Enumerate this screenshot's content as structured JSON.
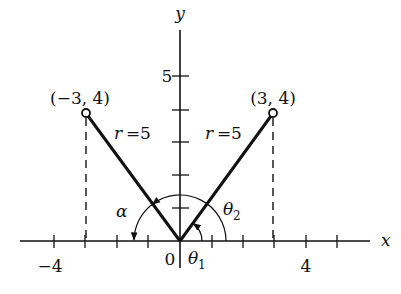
{
  "figure": {
    "axes": {
      "x_label": "x",
      "y_label": "y",
      "origin_label": "0",
      "x_tick_label_neg4": "−4",
      "x_tick_label_4": "4",
      "y_tick_label_5": "5",
      "x_ticks": [
        -4,
        -3,
        -2,
        -1,
        1,
        2,
        3,
        4,
        5
      ],
      "y_ticks": [
        1,
        2,
        3,
        4,
        5
      ]
    },
    "points": [
      {
        "label": "(−3, 4)",
        "x": -3,
        "y": 4
      },
      {
        "label": "(3, 4)",
        "x": 3,
        "y": 4
      }
    ],
    "segments": [
      {
        "label_var": "r",
        "label_eq": "=",
        "label_val": "5",
        "from": [
          0,
          0
        ],
        "to": [
          -3,
          4
        ]
      },
      {
        "label_var": "r",
        "label_eq": "=",
        "label_val": "5",
        "from": [
          0,
          0
        ],
        "to": [
          3,
          4
        ]
      }
    ],
    "angles": {
      "alpha": "α",
      "theta1_sym": "θ",
      "theta1_sub": "1",
      "theta2_sym": "θ",
      "theta2_sub": "2"
    },
    "colors": {
      "ink": "#111111",
      "background": "#ffffff"
    }
  }
}
